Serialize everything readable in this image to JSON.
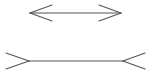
{
  "figure": {
    "type": "muller-lyer-illusion",
    "stroke_color": "#555555",
    "background": "#ffffff",
    "top_line": {
      "y": 13,
      "x1": 30,
      "x2": 121,
      "fin_style": "arrowheads-inward-ends",
      "left_fins": [
        [
          52,
          5
        ],
        [
          52,
          21
        ]
      ],
      "right_fins": [
        [
          99,
          5
        ],
        [
          99,
          21
        ]
      ]
    },
    "bottom_line": {
      "y": 61,
      "x1": 29,
      "x2": 123,
      "fin_style": "tails-outward",
      "left_fins": [
        [
          6,
          53
        ],
        [
          6,
          69
        ]
      ],
      "right_fins": [
        [
          145,
          53
        ],
        [
          145,
          69
        ]
      ]
    }
  }
}
